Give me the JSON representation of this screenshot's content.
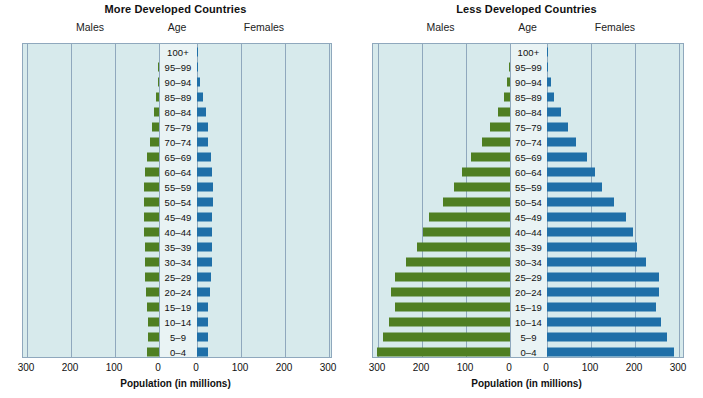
{
  "figure": {
    "axis_title": "Population (in millions)",
    "column_headers": [
      "Males",
      "Age",
      "Females"
    ],
    "colors": {
      "male_bar": "#4f7f22",
      "female_bar": "#1f6fa8",
      "plot_background": "#d7eaec",
      "center_band": "#e9f3f4",
      "gridline": "#8fa8bd"
    }
  },
  "chart_data": [
    {
      "type": "bar",
      "title": "More Developed Countries",
      "subtype": "population-pyramid",
      "xlabel": "Population (in millions)",
      "ylabel": "Age",
      "xlim": [
        0,
        300
      ],
      "xticks": [
        300,
        200,
        100,
        0,
        0,
        100,
        200,
        300
      ],
      "grid": true,
      "categories": [
        "100+",
        "95–99",
        "90–94",
        "85–89",
        "80–84",
        "75–79",
        "70–74",
        "65–69",
        "60–64",
        "55–59",
        "50–54",
        "45–49",
        "40–44",
        "35–39",
        "30–34",
        "25–29",
        "20–24",
        "15–19",
        "10–14",
        "5–9",
        "0–4"
      ],
      "series": [
        {
          "name": "Males",
          "color": "#4f7f22",
          "values": [
            0,
            1,
            3,
            7,
            12,
            17,
            21,
            27,
            31,
            33,
            34,
            33,
            33,
            32,
            32,
            31,
            30,
            27,
            26,
            26,
            27
          ]
        },
        {
          "name": "Females",
          "color": "#1f6fa8",
          "values": [
            1,
            3,
            7,
            13,
            20,
            24,
            26,
            32,
            35,
            36,
            37,
            35,
            34,
            33,
            33,
            32,
            30,
            26,
            25,
            25,
            26
          ]
        }
      ]
    },
    {
      "type": "bar",
      "title": "Less Developed Countries",
      "subtype": "population-pyramid",
      "xlabel": "Population (in millions)",
      "ylabel": "Age",
      "xlim": [
        0,
        300
      ],
      "xticks": [
        300,
        200,
        100,
        0,
        0,
        100,
        200,
        300
      ],
      "grid": true,
      "categories": [
        "100+",
        "95–99",
        "90–94",
        "85–89",
        "80–84",
        "75–79",
        "70–74",
        "65–69",
        "60–64",
        "55–59",
        "50–54",
        "45–49",
        "40–44",
        "35–39",
        "30–34",
        "25–29",
        "20–24",
        "15–19",
        "10–14",
        "5–9",
        "0–4"
      ],
      "series": [
        {
          "name": "Males",
          "color": "#4f7f22",
          "values": [
            0,
            2,
            6,
            14,
            27,
            45,
            63,
            88,
            110,
            128,
            153,
            183,
            198,
            212,
            236,
            262,
            270,
            262,
            274,
            288,
            302
          ]
        },
        {
          "name": "Females",
          "color": "#1f6fa8",
          "values": [
            1,
            3,
            8,
            17,
            31,
            48,
            66,
            92,
            108,
            126,
            152,
            180,
            195,
            205,
            226,
            254,
            254,
            248,
            258,
            272,
            288
          ]
        }
      ]
    }
  ]
}
